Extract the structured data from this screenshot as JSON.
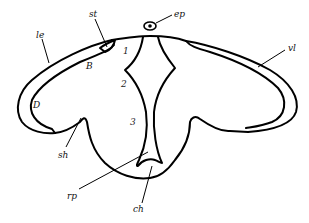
{
  "figure": {
    "type": "anatomical line drawing",
    "labels": {
      "st": "st",
      "ep": "ep",
      "le": "le",
      "vl": "vl",
      "B": "B",
      "D": "D",
      "sh": "sh",
      "rp": "rp",
      "ch": "ch"
    },
    "region_numbers": [
      "1",
      "2",
      "3"
    ]
  }
}
